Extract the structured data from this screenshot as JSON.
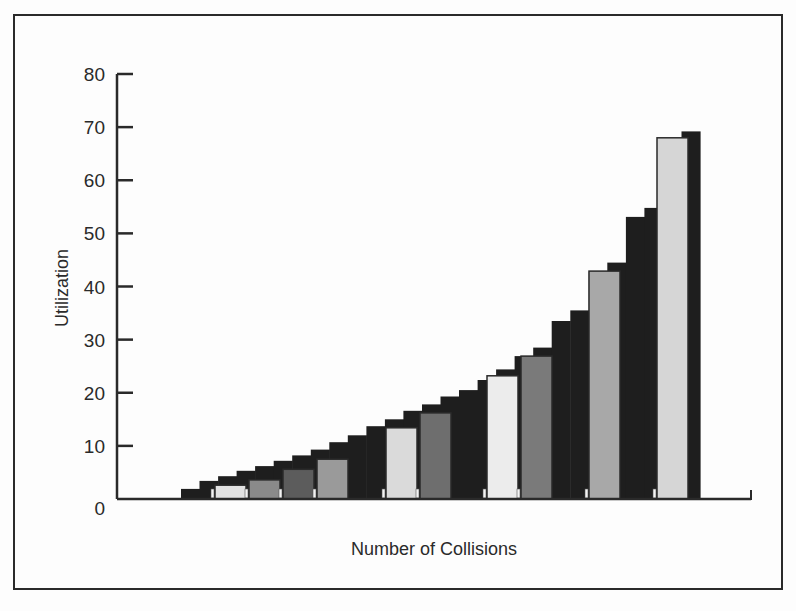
{
  "chart_data": {
    "type": "bar",
    "style": "stepped 3D-style bar chart with dark staircase background and alternating light/gray foreground bars",
    "title": "",
    "xlabel": "Number of Collisions",
    "ylabel": "Utilization",
    "ylim": [
      0,
      80
    ],
    "yticks": [
      0,
      10,
      20,
      30,
      40,
      50,
      60,
      70,
      80
    ],
    "grid": false,
    "legend": null,
    "foreground_bars": {
      "values": [
        2.6,
        3.6,
        5.6,
        7.5,
        13.4,
        16.2,
        23.2,
        26.9,
        42.9,
        68.0
      ],
      "colors": [
        "#e2e2e2",
        "#8a8a8a",
        "#5c5c5c",
        "#9a9a9a",
        "#dadada",
        "#6e6e6e",
        "#ececec",
        "#7a7a7a",
        "#a8a8a8",
        "#d6d6d6"
      ]
    },
    "background_steps": {
      "values": [
        1.9,
        3.4,
        4.3,
        5.3,
        6.2,
        7.2,
        8.2,
        9.3,
        10.7,
        12.0,
        13.7,
        15.0,
        16.6,
        17.8,
        19.3,
        20.5,
        22.4,
        24.4,
        26.9,
        28.5,
        33.5,
        35.5,
        42.8,
        44.5,
        53.1,
        54.8,
        67.0,
        69.2
      ],
      "color": "#1e1e1e"
    }
  },
  "axes": {
    "y_tick_labels": [
      "0",
      "10",
      "20",
      "30",
      "40",
      "50",
      "60",
      "70",
      "80"
    ]
  },
  "labels": {
    "x_axis": "Number of Collisions",
    "y_axis": "Utilization"
  }
}
